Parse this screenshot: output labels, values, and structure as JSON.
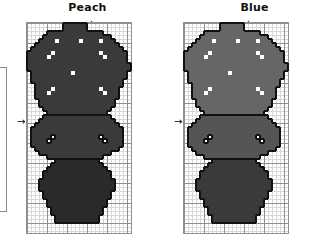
{
  "document": {
    "kind": "cross-stitch-pattern-chart",
    "background_color": "#ffffff"
  },
  "legend_box": {
    "name": "legend-box-cutoff",
    "border_color": "#8a8a8a"
  },
  "panels": [
    {
      "id": "peach",
      "title": "Peach",
      "center_arrow_top": "↓",
      "center_arrow_left": "→",
      "grid": {
        "cols": 26,
        "rows": 52,
        "cell_px": 4,
        "bold_every": 5,
        "minor_line_color": "#d8d8d8",
        "major_line_color": "#8f8f8f"
      },
      "palette": {
        "flowers": "#787878",
        "flowers_alt": "#5f5f5f",
        "leaves": "#5f5f5f",
        "vase": "#6b6b6b",
        "highlight": "#ffffff"
      }
    },
    {
      "id": "blue",
      "title": "Blue",
      "center_arrow_top": "↓",
      "center_arrow_left": "→",
      "grid": {
        "cols": 26,
        "rows": 52,
        "cell_px": 4,
        "bold_every": 5,
        "minor_line_color": "#d8d8d8",
        "major_line_color": "#8f8f8f"
      },
      "palette": {
        "flowers": "#bdbdbd",
        "flowers_alt": "#a9a9a9",
        "leaves": "#6f6f6f",
        "vase": "#6b6b6b",
        "highlight": "#ffffff"
      }
    }
  ],
  "chart_data": {
    "type": "heatmap",
    "legend": [
      "Peach",
      "Blue"
    ],
    "grid_cols": 26,
    "grid_rows": 52,
    "cell_px": 4,
    "shade_keys": {
      "0": "empty",
      "1": "light",
      "2": "mid",
      "3": "dark",
      "4": "white-highlight"
    },
    "peach_shade_map": {
      "1": "s-mid",
      "2": "s-mid",
      "3": "s-dark",
      "4": "s-white"
    },
    "blue_shade_map": {
      "1": "s-pale",
      "2": "s-light",
      "3": "s-mid",
      "4": "s-white"
    },
    "rows": [
      "00000000011111100000000000",
      "00000000011111100000000000",
      "00000111111111111110000000",
      "00001111111111111111100000",
      "00011114111114111141110000",
      "00111111111111111111111000",
      "01111111111111111111111100",
      "11111141111111111141111110",
      "11111411111111111114111110",
      "11111111111111111111111110",
      "11111111111111111111111111",
      "11111111111111111111111111",
      "01111111111411111111111110",
      "01111111111111111111111110",
      "01111111111111111111111100",
      "00111111111111111111111100",
      "00111141111111111141111000",
      "00111411111111111114111000",
      "00111111111111111111111000",
      "00011111111111111111110000",
      "00011111111111111111110000",
      "00001111111111111111100000",
      "00000111111111111111000000",
      "00002222222222222222200000",
      "00022222222222222222220000",
      "00222222222222222222222000",
      "02222222222222222222222200",
      "02222222222222222222222200",
      "02222242222222222242222200",
      "02222422222222222224222200",
      "02222222222222222222222200",
      "00222222222222222222222000",
      "00022222222222222222200000",
      "00000222222222222220000000",
      "00000003333333333300000000",
      "00000033333333333330000000",
      "00000333333333333333000000",
      "00003333333333333333300000",
      "00003333333333333333300000",
      "00033333333333333333330000",
      "00033333333333333333330000",
      "00033333333333333333330000",
      "00003333333333333333300000",
      "00003333333333333333300000",
      "00000333333333333333000000",
      "00000333333333333333000000",
      "00000033333333333330000000",
      "00000033333333333330000000",
      "00000003333333333300000000",
      "00000003333333333300000000",
      "00000000000000000000000000",
      "00000000000000000000000000"
    ]
  }
}
